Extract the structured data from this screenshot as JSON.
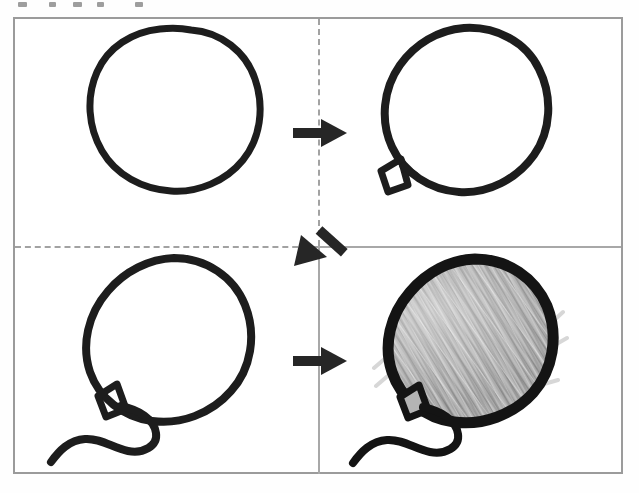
{
  "figure": {
    "kind": "instructional-step-diagram",
    "panel_count": 4,
    "reading_order": "top-left, top-right, bottom-left, bottom-right",
    "background_color": "#ffffff",
    "frame_color": "#9b9b9b",
    "ink_color": "#1d1d1d",
    "shading_color": "#a3a3a3"
  },
  "top_caption_remnant": {
    "description": "bottom pixel fragments of a cut-off line of text above the frame",
    "visible_text": ""
  },
  "panels": [
    {
      "id": "step-1",
      "position": "top-left",
      "title": "Step 1",
      "description": "Plain hand-drawn oval outline (balloon body)",
      "elements": [
        "balloon-body-outline"
      ],
      "shaded": false,
      "has_knot": false,
      "has_string": false
    },
    {
      "id": "step-2",
      "position": "top-right",
      "title": "Step 2",
      "description": "Balloon body with a small diamond knot added at the lower-left",
      "elements": [
        "balloon-body-outline",
        "balloon-knot"
      ],
      "shaded": false,
      "has_knot": true,
      "has_string": false
    },
    {
      "id": "step-3",
      "position": "bottom-left",
      "title": "Step 3",
      "description": "Balloon body, knot, and a wavy S-curved string trailing to the lower-left",
      "elements": [
        "balloon-body-outline",
        "balloon-knot",
        "balloon-string"
      ],
      "shaded": false,
      "has_knot": true,
      "has_string": true
    },
    {
      "id": "step-4",
      "position": "bottom-right",
      "title": "Step 4",
      "description": "Finished balloon: heavier outline, knot, string, and grey diagonal pencil shading filling the body",
      "elements": [
        "balloon-body-outline",
        "balloon-knot",
        "balloon-string",
        "pencil-shading"
      ],
      "shaded": true,
      "has_knot": true,
      "has_string": true
    }
  ],
  "arrows": [
    {
      "id": "arrow-1",
      "label": "step 1 to step 2",
      "direction": "right",
      "from_panel": "step-1",
      "to_panel": "step-2"
    },
    {
      "id": "arrow-2",
      "label": "step 2 to step 3",
      "direction": "down-left",
      "from_panel": "step-2",
      "to_panel": "step-3"
    },
    {
      "id": "arrow-3",
      "label": "step 3 to step 4",
      "direction": "right",
      "from_panel": "step-3",
      "to_panel": "step-4"
    }
  ],
  "dividers": [
    {
      "id": "divider-vertical-top",
      "orientation": "vertical",
      "style": "dashed",
      "half": "top"
    },
    {
      "id": "divider-vertical-bottom",
      "orientation": "vertical",
      "style": "solid",
      "half": "bottom"
    },
    {
      "id": "divider-horizontal-left",
      "orientation": "horizontal",
      "style": "dashed",
      "half": "left"
    },
    {
      "id": "divider-horizontal-right",
      "orientation": "horizontal",
      "style": "solid",
      "half": "right"
    }
  ]
}
